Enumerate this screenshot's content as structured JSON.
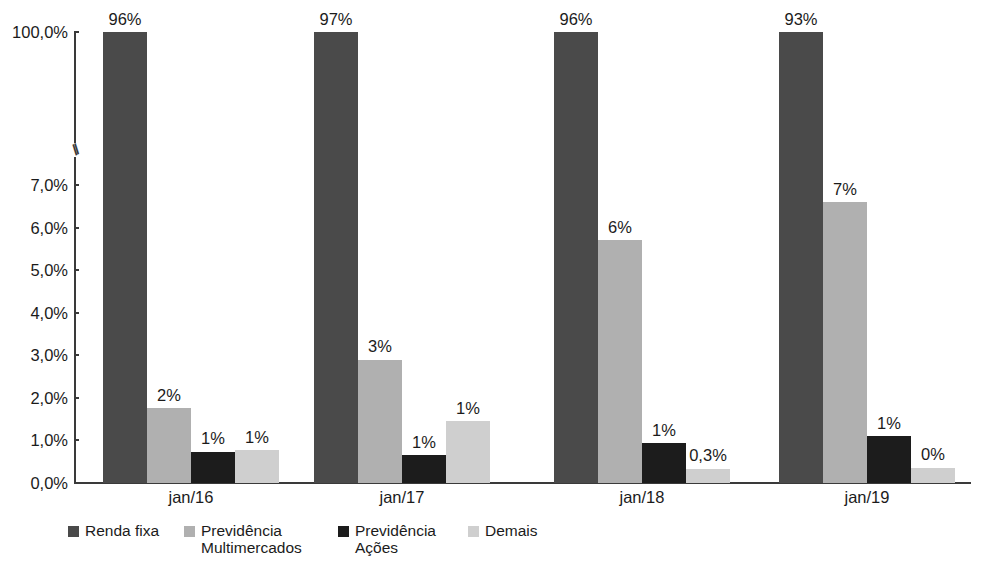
{
  "chart_data": {
    "type": "bar",
    "title": "",
    "subtitle": "",
    "xlabel": "",
    "ylabel": "",
    "grid": false,
    "legend_position": "bottom-left",
    "axis_break": {
      "present": true,
      "glyph": "//",
      "between": [
        "7,0%",
        "100,0%"
      ]
    },
    "ylim": [
      0,
      100
    ],
    "y_ticks": [
      "0,0%",
      "1,0%",
      "2,0%",
      "3,0%",
      "4,0%",
      "5,0%",
      "6,0%",
      "7,0%",
      "100,0%"
    ],
    "categories": [
      "jan/16",
      "jan/17",
      "jan/18",
      "jan/19"
    ],
    "series": [
      {
        "name": "Renda fixa",
        "color": "#4a4a4a",
        "values": [
          96,
          97,
          96,
          93
        ],
        "labels": [
          "96%",
          "97%",
          "96%",
          "93%"
        ],
        "plotted_heights": [
          100,
          100,
          100,
          100
        ]
      },
      {
        "name": "Previdência Multimercados",
        "color": "#b0b0b0",
        "values": [
          2,
          3,
          6,
          7
        ],
        "labels": [
          "2%",
          "3%",
          "6%",
          "7%"
        ],
        "plotted_heights": [
          1.76,
          2.9,
          5.7,
          6.6
        ]
      },
      {
        "name": "Previdência Ações",
        "color": "#1c1c1c",
        "values": [
          1,
          1,
          1,
          1
        ],
        "labels": [
          "1%",
          "1%",
          "1%",
          "1%"
        ],
        "plotted_heights": [
          0.73,
          0.65,
          0.93,
          1.1
        ]
      },
      {
        "name": "Demais",
        "color": "#cfcfcf",
        "values": [
          1,
          1,
          0.3,
          0
        ],
        "labels": [
          "1%",
          "1%",
          "0,3%",
          "0%"
        ],
        "plotted_heights": [
          0.77,
          1.45,
          0.33,
          0.36
        ]
      }
    ]
  },
  "legend": {
    "items": [
      {
        "label": "Renda fixa",
        "color": "#4a4a4a"
      },
      {
        "label": "Previdência\nMultimercados",
        "color": "#b0b0b0"
      },
      {
        "label": "Previdência\nAções",
        "color": "#1c1c1c"
      },
      {
        "label": "Demais",
        "color": "#cfcfcf"
      }
    ]
  },
  "axis": {
    "break_glyph": "//"
  }
}
